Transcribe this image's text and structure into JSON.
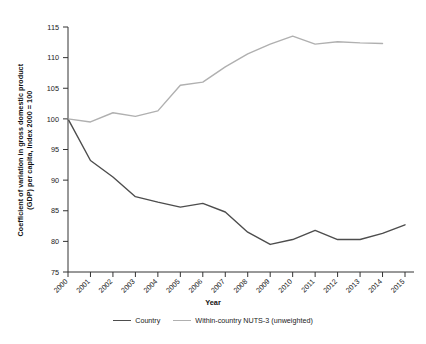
{
  "chart_data": {
    "type": "line",
    "title": "",
    "xlabel": "Year",
    "ylabel": "Coefficient of variation in gross domestic product (GDP) per capita, Index 2000 = 100",
    "ylabel_line1": "Coefficient of variation in gross domestic product",
    "ylabel_line2": "(GDP) per capita, Index 2000 = 100",
    "x": [
      2000,
      2001,
      2002,
      2003,
      2004,
      2005,
      2006,
      2007,
      2008,
      2009,
      2010,
      2011,
      2012,
      2013,
      2014,
      2015
    ],
    "categories": [
      "2000",
      "2001",
      "2002",
      "2003",
      "2004",
      "2005",
      "2006",
      "2007",
      "2008",
      "2009",
      "2010",
      "2011",
      "2012",
      "2013",
      "2014",
      "2015"
    ],
    "xlim": [
      2000,
      2015
    ],
    "ylim": [
      75,
      115
    ],
    "yticks": [
      75,
      80,
      85,
      90,
      95,
      100,
      105,
      110,
      115
    ],
    "ytick_labels": [
      "75",
      "80",
      "85",
      "90",
      "95",
      "100",
      "105",
      "110",
      "115"
    ],
    "grid": false,
    "legend_position": "bottom",
    "series": [
      {
        "name": "Country",
        "color": "#4d4d4d",
        "x": [
          2000,
          2001,
          2002,
          2003,
          2004,
          2005,
          2006,
          2007,
          2008,
          2009,
          2010,
          2011,
          2012,
          2013,
          2014,
          2015
        ],
        "values": [
          100.0,
          93.2,
          90.5,
          87.3,
          86.4,
          85.6,
          86.2,
          84.8,
          81.5,
          79.5,
          80.3,
          81.8,
          80.3,
          80.3,
          81.3,
          82.7
        ]
      },
      {
        "name": "Within-country NUTS-3 (unweighted)",
        "color": "#b0b0b0",
        "x": [
          2000,
          2001,
          2002,
          2003,
          2004,
          2005,
          2006,
          2007,
          2008,
          2009,
          2010,
          2011,
          2012,
          2013,
          2014
        ],
        "values": [
          100.0,
          99.5,
          101.0,
          100.4,
          101.3,
          105.5,
          106.0,
          108.5,
          110.6,
          112.2,
          113.5,
          112.2,
          112.6,
          112.4,
          112.3
        ]
      }
    ]
  },
  "legend": {
    "items": [
      {
        "label": "Country"
      },
      {
        "label": "Within-country NUTS-3 (unweighted)"
      }
    ]
  },
  "axes": {
    "x_title": "Year",
    "y_title_line1": "Coefficient of variation in gross domestic product",
    "y_title_line2": "(GDP) per capita, Index 2000 = 100"
  }
}
